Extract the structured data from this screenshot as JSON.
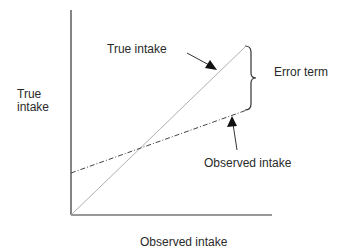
{
  "diagram": {
    "y_axis_label_line1": "True",
    "y_axis_label_line2": "intake",
    "x_axis_label": "Observed intake",
    "true_line_label": "True intake",
    "observed_line_label": "Observed intake",
    "error_label": "Error term",
    "colors": {
      "axis": "#333333",
      "true_line": "#b0b0b0",
      "observed_line": "#444444",
      "text": "#2a2a2a"
    }
  }
}
